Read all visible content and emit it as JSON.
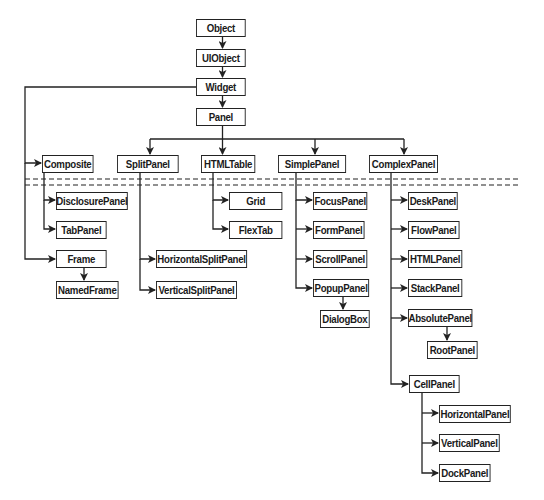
{
  "diagram": {
    "colors": {
      "line": "#222222",
      "box_fill": "#ffffff",
      "text": "#1a1a1a"
    },
    "nodes": {
      "object": "Object",
      "uiobject": "UIObject",
      "widget": "Widget",
      "panel": "Panel",
      "composite": "Composite",
      "splitpanel": "SplitPanel",
      "htmltable": "HTMLTable",
      "simplepanel": "SimplePanel",
      "complexpanel": "ComplexPanel",
      "disclosurepanel": "DisclosurePanel",
      "tabpanel": "TabPanel",
      "frame": "Frame",
      "namedframe": "NamedFrame",
      "horizontalsplitpanel": "HorizontalSplitPanel",
      "verticalsplitpanel": "VerticalSplitPanel",
      "grid": "Grid",
      "flextable": "FlexTab",
      "focuspanel": "FocusPanel",
      "formpanel": "FormPanel",
      "scrollpanel": "ScrollPanel",
      "popuppanel": "PopupPanel",
      "dialogbox": "DialogBox",
      "deskpanel": "DeskPanel",
      "flowpanel": "FlowPanel",
      "htmlpanel": "HTMLPanel",
      "stackpanel": "StackPanel",
      "absolutepanel": "AbsolutePanel",
      "rootpanel": "RootPanel",
      "cellpanel": "CellPanel",
      "horizontalpanel": "HorizontalPanel",
      "verticalpanel": "VerticalPanel",
      "dockpanel": "DockPanel"
    },
    "edges": [
      [
        "Object",
        "UIObject"
      ],
      [
        "UIObject",
        "Widget"
      ],
      [
        "Widget",
        "Panel"
      ],
      [
        "Widget",
        "Composite"
      ],
      [
        "Widget",
        "Frame"
      ],
      [
        "Panel",
        "SplitPanel"
      ],
      [
        "Panel",
        "HTMLTable"
      ],
      [
        "Panel",
        "SimplePanel"
      ],
      [
        "Panel",
        "ComplexPanel"
      ],
      [
        "Composite",
        "DisclosurePanel"
      ],
      [
        "Composite",
        "TabPanel"
      ],
      [
        "Frame",
        "NamedFrame"
      ],
      [
        "SplitPanel",
        "HorizontalSplitPanel"
      ],
      [
        "SplitPanel",
        "VerticalSplitPanel"
      ],
      [
        "HTMLTable",
        "Grid"
      ],
      [
        "HTMLTable",
        "FlexTab"
      ],
      [
        "SimplePanel",
        "FocusPanel"
      ],
      [
        "SimplePanel",
        "FormPanel"
      ],
      [
        "SimplePanel",
        "ScrollPanel"
      ],
      [
        "SimplePanel",
        "PopupPanel"
      ],
      [
        "PopupPanel",
        "DialogBox"
      ],
      [
        "ComplexPanel",
        "DeskPanel"
      ],
      [
        "ComplexPanel",
        "FlowPanel"
      ],
      [
        "ComplexPanel",
        "HTMLPanel"
      ],
      [
        "ComplexPanel",
        "StackPanel"
      ],
      [
        "ComplexPanel",
        "AbsolutePanel"
      ],
      [
        "ComplexPanel",
        "CellPanel"
      ],
      [
        "AbsolutePanel",
        "RootPanel"
      ],
      [
        "CellPanel",
        "HorizontalPanel"
      ],
      [
        "CellPanel",
        "VerticalPanel"
      ],
      [
        "CellPanel",
        "DockPanel"
      ]
    ]
  }
}
